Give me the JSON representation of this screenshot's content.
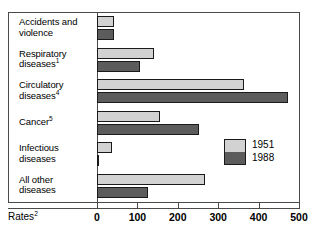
{
  "chart_data": {
    "type": "bar",
    "orientation": "horizontal",
    "title": "",
    "xlabel": "Rates",
    "ylabel": "",
    "xlim": [
      0,
      500
    ],
    "xticks": [
      0,
      100,
      200,
      300,
      400,
      500
    ],
    "xtick_labels": [
      "0",
      "100",
      "200",
      "300",
      "400",
      "500"
    ],
    "grid": false,
    "legend_position": "middle-right",
    "categories": [
      "Accidents and violence",
      "Respiratory diseases",
      "Circulatory diseases",
      "Cancer",
      "Infectious diseases",
      "All other diseases"
    ],
    "category_lines": [
      [
        "Accidents and",
        "violence"
      ],
      [
        "Respiratory",
        "diseases"
      ],
      [
        "Circulatory",
        "diseases"
      ],
      [
        "Cancer"
      ],
      [
        "Infectious",
        "diseases"
      ],
      [
        "All other",
        "diseases"
      ]
    ],
    "category_footnotes": [
      "",
      "1",
      "4",
      "5",
      "",
      ""
    ],
    "series": [
      {
        "name": "1951",
        "color": "#d2d2d2",
        "values": [
          42,
          140,
          365,
          156,
          37,
          268
        ]
      },
      {
        "name": "1988",
        "color": "#5c5c5c",
        "values": [
          42,
          106,
          473,
          252,
          5,
          127
        ]
      }
    ]
  },
  "axis": {
    "caption": "Rates",
    "caption_footnote": "2"
  },
  "legend": {
    "entries": [
      {
        "label": "1951",
        "color": "#d2d2d2"
      },
      {
        "label": "1988",
        "color": "#5c5c5c"
      }
    ]
  },
  "colors": {
    "series_1951": "#d2d2d2",
    "series_1988": "#5c5c5c",
    "bar_outline": "#1a1a1a",
    "frame": "#4a4a4a",
    "background": "#ffffff",
    "text": "#000000"
  }
}
